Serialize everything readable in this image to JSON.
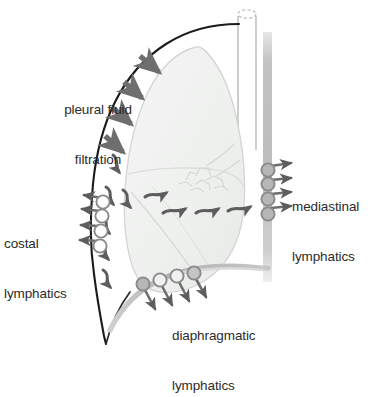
{
  "figure": {
    "kind": "anatomical-diagram",
    "background_color": "#ffffff"
  },
  "labels": {
    "pleural_fluid_filtration": {
      "line1": "pleural fluid",
      "line2": "filtration"
    },
    "costal_lymphatics": {
      "line1": "costal",
      "line2": "lymphatics"
    },
    "mediastinal_lymphatics": {
      "line1": "mediastinal",
      "line2": "lymphatics"
    },
    "diaphragmatic_lymphatics": {
      "line1": "diaphragmatic",
      "line2": "lymphatics"
    }
  },
  "colors": {
    "text": "#2b2b2b",
    "chest_wall": "#1a1a1a",
    "arrow_gray": "#6e6e6e",
    "arrow_dark_gray": "#555555",
    "lymphatic_circle_stroke": "#8a8a8a",
    "lymphatic_circle_fill_light": "#ffffff",
    "lymphatic_circle_fill_gray": "#b4b4b4",
    "lung_fill": "#f1f2f1",
    "lung_stroke": "#cfd2cf",
    "mediastinum_band": "#c9c9c9",
    "diaphragm": "#b9b9b9",
    "trachea_stroke": "#b0b0b0"
  },
  "structures": {
    "chest_wall": "dark curved line from apex down the lateral chest to the costophrenic angle",
    "lung": "pale gray shaded lung with horizontal and oblique fissures and central hilum",
    "trachea": "vertical tube at top right with elliptical opening",
    "mediastinum": "vertical gray band on the right side",
    "diaphragm": "gray band sloping up to the right at the lung base"
  },
  "flow_markers": {
    "filtration_arrows": {
      "count": 4,
      "direction": "inward across the parietal pleura",
      "description": "thick gray arrows crossing the chest wall"
    },
    "pleural_space_squiggles_lateral": {
      "count": 6,
      "direction": "downward along the costal pleural space",
      "description": "small curved arrows showing fluid movement down the lateral pleural space"
    },
    "pleural_space_squiggles_basal": {
      "count": 4,
      "direction": "rightward toward the mediastinum",
      "description": "small curved arrows along the lung base"
    },
    "costal_lymphatics": {
      "circle_count": 4,
      "arrow_count": 4,
      "arrow_direction": "left, out through the chest wall"
    },
    "mediastinal_lymphatics": {
      "circle_count": 4,
      "arrow_count": 4,
      "arrow_direction": "right, out into the mediastinum"
    },
    "diaphragmatic_lymphatics": {
      "circle_count": 4,
      "arrow_count": 4,
      "arrow_direction": "downward through the diaphragm"
    }
  }
}
